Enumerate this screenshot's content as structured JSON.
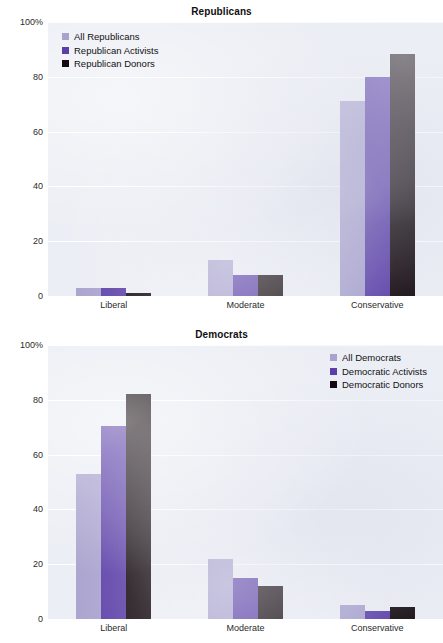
{
  "page": {
    "background": "#ffffff",
    "plot_background": "#eceef5"
  },
  "palette": {
    "light": "#a9a2ce",
    "mid": "#5b3fa8",
    "dark": "#140a0f",
    "gridline": "#ffffff",
    "text": "#1a1a1a"
  },
  "charts": [
    {
      "id": "republicans",
      "title": "Republicans",
      "legend_position": "top-left",
      "y_ticks": [
        "100%",
        "80",
        "60",
        "40",
        "20",
        "0"
      ],
      "x_ticks": [
        "Liberal",
        "Moderate",
        "Conservative"
      ],
      "legend": [
        {
          "label": "All Republicans",
          "color": "#a9a2ce"
        },
        {
          "label": "Republican Activists",
          "color": "#5b3fa8"
        },
        {
          "label": "Republican Donors",
          "color": "#140a0f"
        }
      ]
    },
    {
      "id": "democrats",
      "title": "Democrats",
      "legend_position": "top-right",
      "y_ticks": [
        "100%",
        "80",
        "60",
        "40",
        "20",
        "0"
      ],
      "x_ticks": [
        "Liberal",
        "Moderate",
        "Conservative"
      ],
      "legend": [
        {
          "label": "All Democrats",
          "color": "#a9a2ce"
        },
        {
          "label": "Democratic Activists",
          "color": "#5b3fa8"
        },
        {
          "label": "Democratic Donors",
          "color": "#140a0f"
        }
      ]
    }
  ],
  "chart_data": [
    {
      "type": "bar",
      "title": "Republicans",
      "xlabel": "",
      "ylabel": "",
      "ylim": [
        0,
        100
      ],
      "yticks": [
        0,
        20,
        40,
        60,
        80,
        100
      ],
      "ytick_labels": [
        "0",
        "20",
        "40",
        "60",
        "80",
        "100%"
      ],
      "grid": true,
      "legend_position": "upper left",
      "categories": [
        "Liberal",
        "Moderate",
        "Conservative"
      ],
      "series": [
        {
          "name": "All Republicans",
          "color": "#a9a2ce",
          "values": [
            3,
            13,
            71
          ]
        },
        {
          "name": "Republican Activists",
          "color": "#5b3fa8",
          "values": [
            3,
            7.5,
            80
          ]
        },
        {
          "name": "Republican Donors",
          "color": "#140a0f",
          "values": [
            1,
            7.5,
            88.5
          ]
        }
      ]
    },
    {
      "type": "bar",
      "title": "Democrats",
      "xlabel": "",
      "ylabel": "",
      "ylim": [
        0,
        100
      ],
      "yticks": [
        0,
        20,
        40,
        60,
        80,
        100
      ],
      "ytick_labels": [
        "0",
        "20",
        "40",
        "60",
        "80",
        "100%"
      ],
      "grid": true,
      "legend_position": "upper right",
      "categories": [
        "Liberal",
        "Moderate",
        "Conservative"
      ],
      "series": [
        {
          "name": "All Democrats",
          "color": "#a9a2ce",
          "values": [
            53,
            22,
            5
          ]
        },
        {
          "name": "Democratic Activists",
          "color": "#5b3fa8",
          "values": [
            70.5,
            15,
            3
          ]
        },
        {
          "name": "Democratic Donors",
          "color": "#140a0f",
          "values": [
            82,
            12,
            4.5
          ]
        }
      ]
    }
  ]
}
